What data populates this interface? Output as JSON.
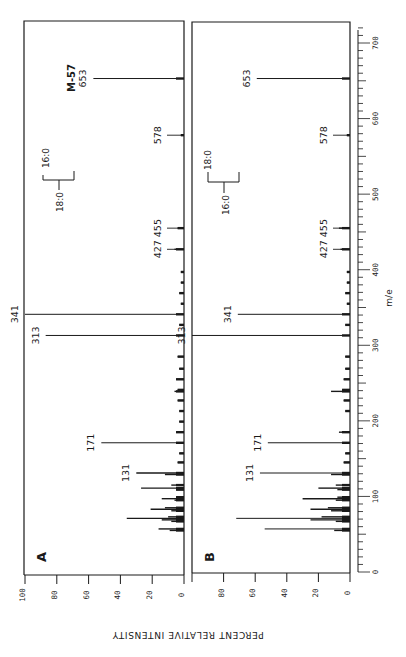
{
  "chart_data": {
    "type": "bar",
    "title": "",
    "xlabel": "m/e",
    "ylabel": "PERCENT RELATIVE INTENSITY",
    "xlim": [
      0,
      700
    ],
    "ylim": [
      0,
      100
    ],
    "orientation": "rotated 90 degrees counter-clockwise (m/e axis vertical, increasing upward; intensity increases leftward)",
    "x_ticks": [
      0,
      100,
      200,
      300,
      400,
      500,
      600,
      700
    ],
    "y_ticks": [
      0,
      20,
      40,
      60,
      80,
      100
    ],
    "panels": [
      {
        "label": "A",
        "annotations": [
          {
            "text": "M-57",
            "mz": 653
          },
          {
            "text": "16:0 / 18:0 bracket",
            "upper": "16:0",
            "lower": "18:0"
          }
        ],
        "peaks": [
          {
            "mz": 55,
            "intensity": 9,
            "label": ""
          },
          {
            "mz": 57,
            "intensity": 16,
            "label": ""
          },
          {
            "mz": 67,
            "intensity": 8,
            "label": ""
          },
          {
            "mz": 69,
            "intensity": 14,
            "label": ""
          },
          {
            "mz": 71,
            "intensity": 36,
            "label": ""
          },
          {
            "mz": 73,
            "intensity": 10,
            "label": ""
          },
          {
            "mz": 81,
            "intensity": 8,
            "label": ""
          },
          {
            "mz": 83,
            "intensity": 21,
            "label": ""
          },
          {
            "mz": 85,
            "intensity": 12,
            "label": ""
          },
          {
            "mz": 95,
            "intensity": 6,
            "label": ""
          },
          {
            "mz": 97,
            "intensity": 14,
            "label": ""
          },
          {
            "mz": 99,
            "intensity": 5,
            "label": ""
          },
          {
            "mz": 109,
            "intensity": 5,
            "label": ""
          },
          {
            "mz": 111,
            "intensity": 27,
            "label": ""
          },
          {
            "mz": 115,
            "intensity": 8,
            "label": ""
          },
          {
            "mz": 129,
            "intensity": 12,
            "label": ""
          },
          {
            "mz": 131,
            "intensity": 30,
            "label": "131"
          },
          {
            "mz": 145,
            "intensity": 4,
            "label": ""
          },
          {
            "mz": 157,
            "intensity": 3,
            "label": ""
          },
          {
            "mz": 171,
            "intensity": 52,
            "label": "171"
          },
          {
            "mz": 185,
            "intensity": 5,
            "label": ""
          },
          {
            "mz": 199,
            "intensity": 3,
            "label": ""
          },
          {
            "mz": 213,
            "intensity": 3,
            "label": ""
          },
          {
            "mz": 227,
            "intensity": 4,
            "label": ""
          },
          {
            "mz": 239,
            "intensity": 6,
            "label": ""
          },
          {
            "mz": 241,
            "intensity": 4,
            "label": ""
          },
          {
            "mz": 255,
            "intensity": 5,
            "label": ""
          },
          {
            "mz": 269,
            "intensity": 3,
            "label": ""
          },
          {
            "mz": 285,
            "intensity": 4,
            "label": ""
          },
          {
            "mz": 313,
            "intensity": 87,
            "label": "313"
          },
          {
            "mz": 327,
            "intensity": 3,
            "label": ""
          },
          {
            "mz": 341,
            "intensity": 100,
            "label": "341"
          },
          {
            "mz": 355,
            "intensity": 2,
            "label": ""
          },
          {
            "mz": 369,
            "intensity": 3,
            "label": ""
          },
          {
            "mz": 383,
            "intensity": 2,
            "label": ""
          },
          {
            "mz": 397,
            "intensity": 2,
            "label": ""
          },
          {
            "mz": 427,
            "intensity": 6,
            "label": "427"
          },
          {
            "mz": 455,
            "intensity": 4,
            "label": "455"
          },
          {
            "mz": 578,
            "intensity": 2,
            "label": "578"
          },
          {
            "mz": 653,
            "intensity": 57,
            "label": "653"
          }
        ]
      },
      {
        "label": "B",
        "annotations": [
          {
            "text": "18:0 / 16:0 bracket",
            "upper": "18:0",
            "lower": "16:0"
          }
        ],
        "peaks": [
          {
            "mz": 55,
            "intensity": 10,
            "label": ""
          },
          {
            "mz": 57,
            "intensity": 54,
            "label": ""
          },
          {
            "mz": 67,
            "intensity": 9,
            "label": ""
          },
          {
            "mz": 69,
            "intensity": 25,
            "label": ""
          },
          {
            "mz": 71,
            "intensity": 72,
            "label": ""
          },
          {
            "mz": 73,
            "intensity": 18,
            "label": ""
          },
          {
            "mz": 81,
            "intensity": 12,
            "label": ""
          },
          {
            "mz": 83,
            "intensity": 25,
            "label": ""
          },
          {
            "mz": 85,
            "intensity": 14,
            "label": ""
          },
          {
            "mz": 95,
            "intensity": 9,
            "label": ""
          },
          {
            "mz": 97,
            "intensity": 30,
            "label": ""
          },
          {
            "mz": 99,
            "intensity": 8,
            "label": ""
          },
          {
            "mz": 109,
            "intensity": 8,
            "label": ""
          },
          {
            "mz": 111,
            "intensity": 20,
            "label": ""
          },
          {
            "mz": 115,
            "intensity": 9,
            "label": ""
          },
          {
            "mz": 129,
            "intensity": 12,
            "label": ""
          },
          {
            "mz": 131,
            "intensity": 57,
            "label": "131"
          },
          {
            "mz": 145,
            "intensity": 4,
            "label": ""
          },
          {
            "mz": 157,
            "intensity": 3,
            "label": ""
          },
          {
            "mz": 171,
            "intensity": 52,
            "label": "171"
          },
          {
            "mz": 185,
            "intensity": 7,
            "label": ""
          },
          {
            "mz": 213,
            "intensity": 3,
            "label": ""
          },
          {
            "mz": 227,
            "intensity": 4,
            "label": ""
          },
          {
            "mz": 239,
            "intensity": 12,
            "label": ""
          },
          {
            "mz": 241,
            "intensity": 5,
            "label": ""
          },
          {
            "mz": 255,
            "intensity": 4,
            "label": ""
          },
          {
            "mz": 269,
            "intensity": 3,
            "label": ""
          },
          {
            "mz": 285,
            "intensity": 3,
            "label": ""
          },
          {
            "mz": 313,
            "intensity": 100,
            "label": "313"
          },
          {
            "mz": 327,
            "intensity": 3,
            "label": ""
          },
          {
            "mz": 341,
            "intensity": 71,
            "label": "341"
          },
          {
            "mz": 355,
            "intensity": 2,
            "label": ""
          },
          {
            "mz": 369,
            "intensity": 3,
            "label": ""
          },
          {
            "mz": 383,
            "intensity": 2,
            "label": ""
          },
          {
            "mz": 397,
            "intensity": 2,
            "label": ""
          },
          {
            "mz": 427,
            "intensity": 6,
            "label": "427"
          },
          {
            "mz": 455,
            "intensity": 7,
            "label": "455"
          },
          {
            "mz": 578,
            "intensity": 2,
            "label": "578"
          },
          {
            "mz": 653,
            "intensity": 59,
            "label": "653"
          }
        ]
      }
    ],
    "grid": false,
    "legend": null
  },
  "labels": {
    "x_axis": "m/e",
    "y_axis": "PERCENT RELATIVE INTENSITY",
    "panel_a": "A",
    "panel_b": "B",
    "m57": "M-57",
    "bracket_a_upper": "16:0",
    "bracket_a_lower": "18:0",
    "bracket_b_upper": "18:0",
    "bracket_b_lower": "16:0"
  },
  "colors": {
    "ink": "#1a1a1a",
    "background": "#ffffff"
  }
}
